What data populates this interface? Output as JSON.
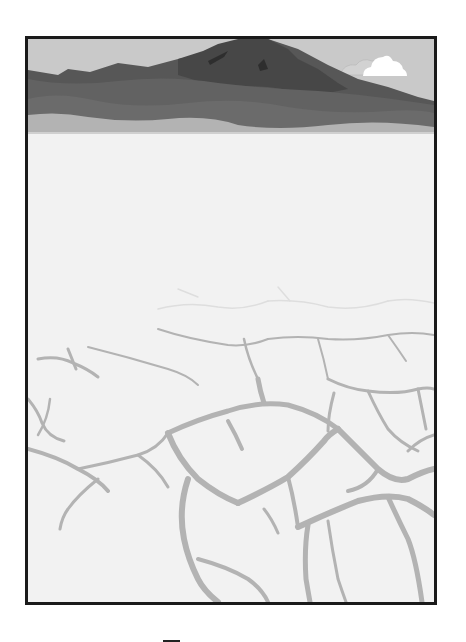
{
  "illustration": {
    "subject": "dry cracked desert floor with distant mountain range",
    "colors": {
      "frame_border": "#1a1a1a",
      "sky": "#c9c9c9",
      "mountain_peak": "#4a4a4a",
      "mountain_range": "#5a5a5a",
      "foothills": "#6a6a6a",
      "haze_band": "#b5b5b5",
      "ground": "#f2f2f2",
      "cracks": "#b3b3b3",
      "cloud": "#ffffff"
    }
  }
}
